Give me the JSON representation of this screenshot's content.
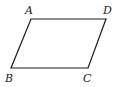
{
  "figure": {
    "shape": "parallelogram",
    "vertices": [
      {
        "label": "A",
        "x": 31,
        "y": 19,
        "lx": 25,
        "ly": 14
      },
      {
        "label": "D",
        "x": 106,
        "y": 19,
        "lx": 103,
        "ly": 14
      },
      {
        "label": "C",
        "x": 88,
        "y": 68,
        "lx": 83,
        "ly": 82
      },
      {
        "label": "B",
        "x": 11,
        "y": 68,
        "lx": 5,
        "ly": 82
      }
    ],
    "stroke_color": "#1a1a1a",
    "label_color": "#222222"
  }
}
